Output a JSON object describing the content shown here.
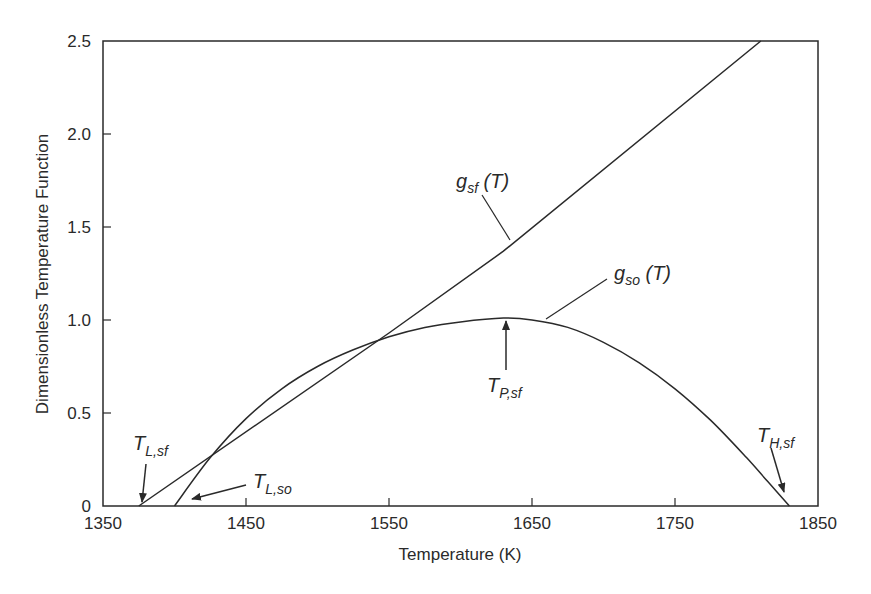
{
  "chart_data": {
    "type": "line",
    "title": "",
    "xlabel": "Temperature (K)",
    "ylabel": "Dimensionless Temperature Function",
    "xlim": [
      1350,
      1850
    ],
    "ylim": [
      0,
      2.5
    ],
    "grid": false,
    "legend": "none (curves labeled inline)",
    "x_ticks": [
      "1350",
      "1450",
      "1550",
      "1650",
      "1750",
      "1850"
    ],
    "y_ticks": [
      "0",
      "0.5",
      "1.0",
      "1.5",
      "2.0",
      "2.5"
    ],
    "series": [
      {
        "name": "g_sf (T)",
        "x": [
          1375,
          1550,
          1630,
          1810
        ],
        "y": [
          0,
          0.93,
          1.37,
          2.5
        ]
      },
      {
        "name": "g_so (T)",
        "x": [
          1400,
          1425,
          1450,
          1475,
          1500,
          1525,
          1550,
          1575,
          1600,
          1630,
          1650,
          1675,
          1700,
          1725,
          1750,
          1775,
          1800,
          1815,
          1830
        ],
        "y": [
          0,
          0.26,
          0.47,
          0.63,
          0.75,
          0.84,
          0.91,
          0.96,
          0.99,
          1.01,
          1.0,
          0.96,
          0.88,
          0.77,
          0.63,
          0.46,
          0.26,
          0.13,
          0
        ]
      }
    ],
    "annotations": [
      {
        "label": "g_sf (T)",
        "points_to": [
          1630,
          1.37
        ]
      },
      {
        "label": "g_so (T)",
        "points_to": [
          1660,
          1.0
        ]
      },
      {
        "label": "T_P,sf",
        "points_to": [
          1630,
          1.01
        ],
        "description": "peak of g_so"
      },
      {
        "label": "T_L,sf",
        "points_to": [
          1375,
          0
        ]
      },
      {
        "label": "T_L,so",
        "points_to": [
          1400,
          0
        ]
      },
      {
        "label": "T_H,sf",
        "points_to": [
          1830,
          0
        ]
      }
    ]
  },
  "labels": {
    "x_axis_title": "Temperature (K)",
    "y_axis_title": "Dimensionless Temperature Function",
    "x_ticks": [
      "1350",
      "1450",
      "1550",
      "1650",
      "1750",
      "1850"
    ],
    "y_ticks": [
      "0",
      "0.5",
      "1.0",
      "1.5",
      "2.0",
      "2.5"
    ],
    "g_sf": {
      "main": "g",
      "sub": "sf",
      "arg": " (T)"
    },
    "g_so": {
      "main": "g",
      "sub": "so",
      "arg": " (T)"
    },
    "T_P_sf": {
      "main": "T",
      "sub": "P,sf"
    },
    "T_L_sf": {
      "main": "T",
      "sub": "L,sf"
    },
    "T_L_so": {
      "main": "T",
      "sub": "L,so"
    },
    "T_H_sf": {
      "main": "T",
      "sub": "H,sf"
    }
  },
  "colors": {
    "line": "#2a2a2a",
    "background": "#ffffff"
  }
}
